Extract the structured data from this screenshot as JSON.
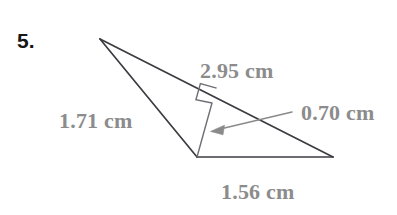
{
  "problem": {
    "number": "5."
  },
  "figure": {
    "type": "triangle-with-altitude",
    "background_color": "#ffffff",
    "stroke_color": "#3b3b42",
    "label_color": "#8c8c8c",
    "arrow_color": "#8a8a8a",
    "vertices": {
      "apex": {
        "x": 100,
        "y": 39
      },
      "bottom": {
        "x": 197,
        "y": 157
      },
      "right": {
        "x": 333,
        "y": 157
      }
    },
    "altitude": {
      "from": {
        "x": 197,
        "y": 157
      },
      "foot": {
        "x": 212,
        "y": 103
      }
    },
    "right_angle_marker": {
      "size": 17
    },
    "arrow": {
      "tail": {
        "x": 292,
        "y": 112
      },
      "head": {
        "x": 212,
        "y": 131
      }
    }
  },
  "labels": {
    "hypotenuse": "2.95 cm",
    "left_side": "1.71 cm",
    "height": "0.70 cm",
    "base": "1.56 cm"
  }
}
